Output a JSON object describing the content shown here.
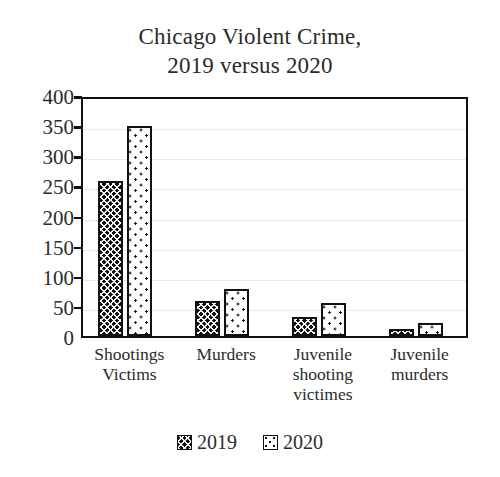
{
  "chart_data": {
    "type": "bar",
    "title": "Chicago Violent Crime, 2019 versus 2020",
    "title_lines": [
      "Chicago Violent Crime,",
      "2019 versus 2020"
    ],
    "categories": [
      "Shootings Victims",
      "Murders",
      "Juvenile shooting victimes",
      "Juvenile murders"
    ],
    "category_lines": [
      [
        "Shootings",
        "Victims"
      ],
      [
        "Murders"
      ],
      [
        "Juvenile",
        "shooting",
        "victimes"
      ],
      [
        "Juvenile",
        "murders"
      ]
    ],
    "series": [
      {
        "name": "2019",
        "values": [
          257,
          58,
          32,
          11
        ],
        "pattern": "dark-crosshatch",
        "color": "#111111"
      },
      {
        "name": "2020",
        "values": [
          349,
          78,
          55,
          21
        ],
        "pattern": "white-dotted",
        "color": "#ffffff"
      }
    ],
    "xlabel": "",
    "ylabel": "",
    "ylim": [
      0,
      400
    ],
    "ytick_values": [
      400,
      350,
      300,
      250,
      200,
      150,
      100,
      50,
      0
    ],
    "ytick_labels": [
      "400",
      "350",
      "300",
      "250",
      "200",
      "150",
      "100",
      "50",
      "0"
    ],
    "grid": true,
    "grid_axis": "y",
    "legend_position": "bottom-center",
    "legend_entries": [
      "2019",
      "2020"
    ]
  }
}
